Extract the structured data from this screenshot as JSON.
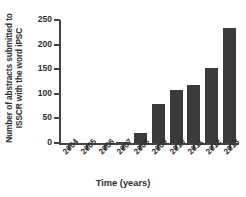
{
  "chart_data": {
    "type": "bar",
    "title": "",
    "xlabel": "Time (years)",
    "ylabel_line1": "Number of abstracts submitted to",
    "ylabel_line2": "ISSCR with the word iPSC",
    "categories": [
      "2004",
      "2005",
      "2006",
      "2007",
      "2008",
      "2009",
      "2010",
      "2011",
      "2012",
      "2013"
    ],
    "values": [
      0,
      0,
      0,
      3,
      20,
      80,
      108,
      117,
      153,
      233
    ],
    "ylim": [
      0,
      250
    ],
    "yticks": [
      0,
      50,
      100,
      150,
      200,
      250
    ],
    "ytick_labels": [
      "0",
      "50",
      "100",
      "150",
      "200",
      "250"
    ],
    "grid": false,
    "legend": "none",
    "bar_color": "#3b3b3b",
    "axis_color": "#444444",
    "background": "#ffffff"
  }
}
